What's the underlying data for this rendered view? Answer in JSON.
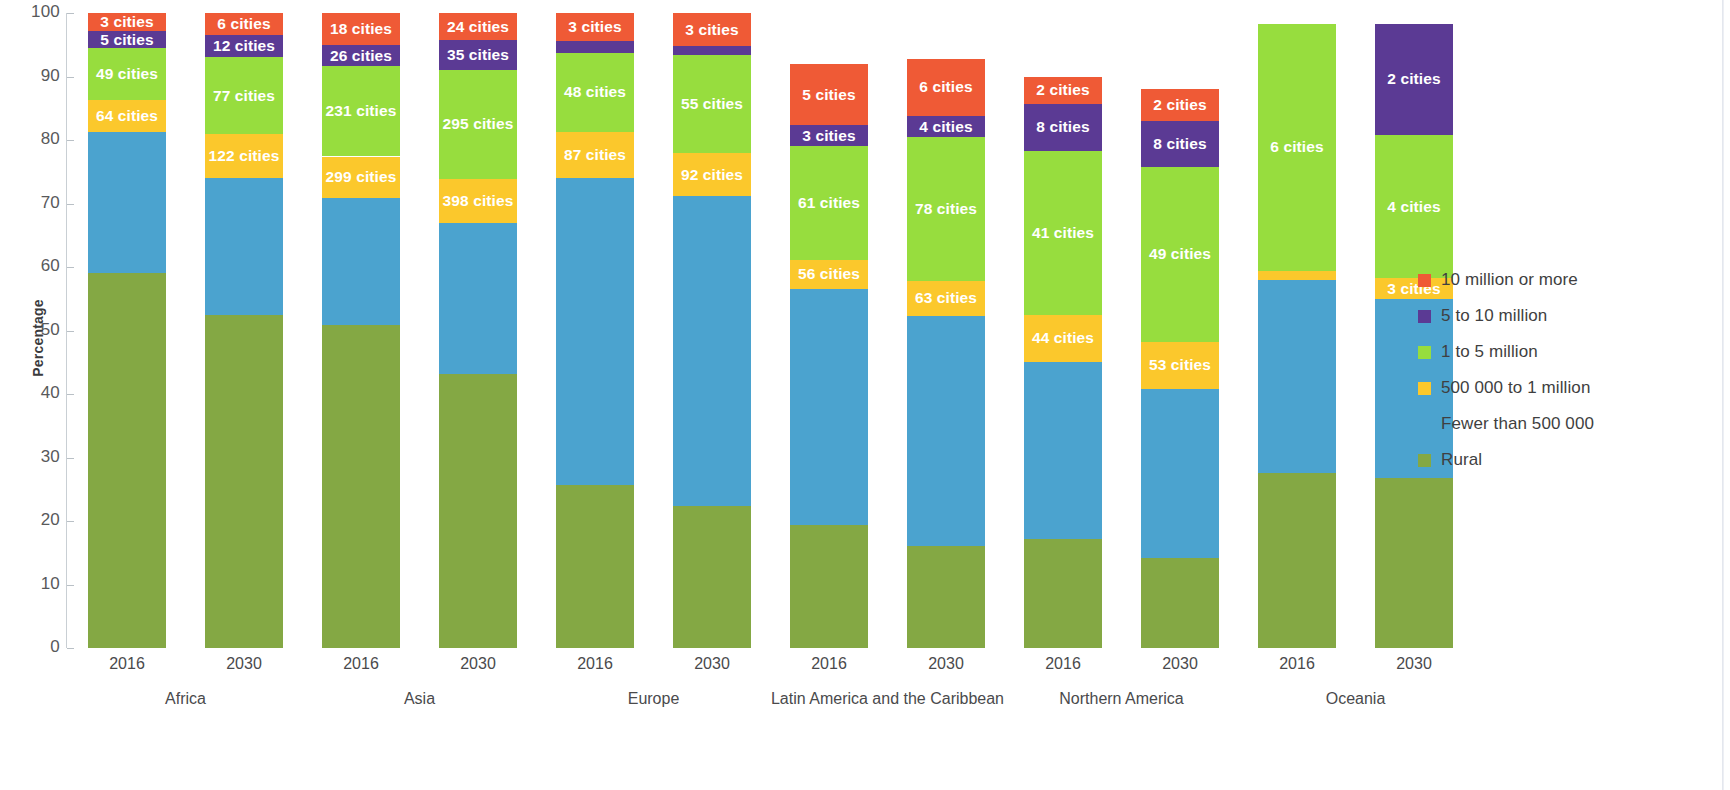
{
  "axis": {
    "y_title": "Percentage",
    "y_ticks": [
      0,
      10,
      20,
      30,
      40,
      50,
      60,
      70,
      80,
      90,
      100
    ],
    "y_min": 0,
    "y_max": 100
  },
  "legend": {
    "items": [
      {
        "label": "10 million or more",
        "color": "#ef5a36"
      },
      {
        "label": "5 to 10 million",
        "color": "#5b3a94"
      },
      {
        "label": "1 to 5 million",
        "color": "#97dd3e"
      },
      {
        "label": "500 000 to 1 million",
        "color": "#fbc82c"
      },
      {
        "label": "Fewer than 500 000",
        "color": "#4ba3cf"
      },
      {
        "label": "Rural",
        "color": "#84a844"
      }
    ]
  },
  "chart_data": {
    "type": "bar",
    "stacked": true,
    "title": "",
    "xlabel": "",
    "ylabel": "Percentage",
    "ylim": [
      0,
      100
    ],
    "grid": false,
    "legend_position": "right",
    "categories": [
      "Africa 2016",
      "Africa 2030",
      "Asia 2016",
      "Asia 2030",
      "Europe 2016",
      "Europe 2030",
      "Latin America and the Caribbean 2016",
      "Latin America and the Caribbean 2030",
      "Northern America 2016",
      "Northern America 2030",
      "Oceania 2016",
      "Oceania 2030"
    ],
    "groups": [
      {
        "name": "Africa",
        "years": [
          "2016",
          "2030"
        ]
      },
      {
        "name": "Asia",
        "years": [
          "2016",
          "2030"
        ]
      },
      {
        "name": "Europe",
        "years": [
          "2016",
          "2030"
        ]
      },
      {
        "name": "Latin America and the Caribbean",
        "years": [
          "2016",
          "2030"
        ]
      },
      {
        "name": "Northern America",
        "years": [
          "2016",
          "2030"
        ]
      },
      {
        "name": "Oceania",
        "years": [
          "2016",
          "2030"
        ]
      }
    ],
    "series": [
      {
        "name": "Rural",
        "color": "#84a844",
        "values": [
          59.0,
          52.5,
          50.8,
          43.1,
          25.7,
          22.3,
          19.3,
          16.0,
          17.1,
          14.2,
          27.5,
          26.8
        ]
      },
      {
        "name": "Fewer than 500 000",
        "color": "#4ba3cf",
        "values": [
          22.3,
          21.5,
          20.1,
          23.8,
          48.3,
          48.9,
          37.3,
          36.3,
          28.0,
          26.6,
          30.4,
          28.2
        ]
      },
      {
        "name": "500 000 to 1 million",
        "color": "#fbc82c",
        "values": [
          5.0,
          7.0,
          6.5,
          7.0,
          7.3,
          6.7,
          4.5,
          5.5,
          7.3,
          7.4,
          1.5,
          3.2
        ]
      },
      {
        "name": "1 to 5 million",
        "color": "#97dd3e",
        "values": [
          8.2,
          12.0,
          14.2,
          17.1,
          12.4,
          15.5,
          18.0,
          22.6,
          25.9,
          27.6,
          38.9,
          22.6
        ]
      },
      {
        "name": "5 to 10 million",
        "color": "#5b3a94",
        "values": [
          2.6,
          3.5,
          3.3,
          4.7,
          1.9,
          1.4,
          3.2,
          3.4,
          7.4,
          7.2,
          0.0,
          17.5
        ]
      },
      {
        "name": "10 million or more",
        "color": "#ef5a36",
        "values": [
          2.9,
          3.5,
          5.1,
          4.3,
          4.4,
          5.2,
          9.7,
          9.0,
          4.3,
          5.0,
          0.0,
          0.0
        ]
      }
    ],
    "bar_labels": [
      {
        "category": "Africa 2016",
        "labels": [
          {
            "series": "Rural",
            "text": ""
          },
          {
            "series": "Fewer than 500 000",
            "text": ""
          },
          {
            "series": "500 000 to 1 million",
            "text": "64 cities"
          },
          {
            "series": "1 to 5 million",
            "text": "49 cities"
          },
          {
            "series": "5 to 10 million",
            "text": "5 cities"
          },
          {
            "series": "10 million or more",
            "text": "3 cities"
          }
        ]
      },
      {
        "category": "Africa 2030",
        "labels": [
          {
            "series": "Rural",
            "text": ""
          },
          {
            "series": "Fewer than 500 000",
            "text": ""
          },
          {
            "series": "500 000 to 1 million",
            "text": "122 cities"
          },
          {
            "series": "1 to 5 million",
            "text": "77 cities"
          },
          {
            "series": "5 to 10 million",
            "text": "12 cities"
          },
          {
            "series": "10 million or more",
            "text": "6 cities"
          }
        ]
      },
      {
        "category": "Asia 2016",
        "labels": [
          {
            "series": "Rural",
            "text": ""
          },
          {
            "series": "Fewer than 500 000",
            "text": ""
          },
          {
            "series": "500 000 to 1 million",
            "text": "299 cities"
          },
          {
            "series": "1 to 5 million",
            "text": "231 cities"
          },
          {
            "series": "5 to 10 million",
            "text": "26 cities"
          },
          {
            "series": "10 million or more",
            "text": "18 cities"
          }
        ]
      },
      {
        "category": "Asia 2030",
        "labels": [
          {
            "series": "Rural",
            "text": ""
          },
          {
            "series": "Fewer than 500 000",
            "text": ""
          },
          {
            "series": "500 000 to 1 million",
            "text": "398 cities"
          },
          {
            "series": "1 to 5 million",
            "text": "295 cities"
          },
          {
            "series": "5 to 10 million",
            "text": "35 cities"
          },
          {
            "series": "10 million or more",
            "text": "24 cities"
          }
        ]
      },
      {
        "category": "Europe 2016",
        "labels": [
          {
            "series": "Rural",
            "text": ""
          },
          {
            "series": "Fewer than 500 000",
            "text": ""
          },
          {
            "series": "500 000 to 1 million",
            "text": "87 cities"
          },
          {
            "series": "1 to 5 million",
            "text": "48 cities"
          },
          {
            "series": "5 to 10 million",
            "text": "3 cities"
          },
          {
            "series": "10 million or more",
            "text": "3 cities"
          }
        ]
      },
      {
        "category": "Europe 2030",
        "labels": [
          {
            "series": "Rural",
            "text": ""
          },
          {
            "series": "Fewer than 500 000",
            "text": ""
          },
          {
            "series": "500 000 to 1 million",
            "text": "92 cities"
          },
          {
            "series": "1 to 5 million",
            "text": "55 cities"
          },
          {
            "series": "5 to 10 million",
            "text": "2 cities"
          },
          {
            "series": "10 million or more",
            "text": "3 cities"
          }
        ]
      },
      {
        "category": "Latin America and the Caribbean 2016",
        "labels": [
          {
            "series": "Rural",
            "text": ""
          },
          {
            "series": "Fewer than 500 000",
            "text": ""
          },
          {
            "series": "500 000 to 1 million",
            "text": "56 cities"
          },
          {
            "series": "1 to 5 million",
            "text": "61 cities"
          },
          {
            "series": "5 to 10 million",
            "text": "3 cities"
          },
          {
            "series": "10 million or more",
            "text": "5 cities"
          }
        ]
      },
      {
        "category": "Latin America and the Caribbean 2030",
        "labels": [
          {
            "series": "Rural",
            "text": ""
          },
          {
            "series": "Fewer than 500 000",
            "text": ""
          },
          {
            "series": "500 000 to 1 million",
            "text": "63 cities"
          },
          {
            "series": "1 to 5 million",
            "text": "78 cities"
          },
          {
            "series": "5 to 10 million",
            "text": "4 cities"
          },
          {
            "series": "10 million or more",
            "text": "6 cities"
          }
        ]
      },
      {
        "category": "Northern America 2016",
        "labels": [
          {
            "series": "Rural",
            "text": ""
          },
          {
            "series": "Fewer than 500 000",
            "text": ""
          },
          {
            "series": "500 000 to 1 million",
            "text": "44 cities"
          },
          {
            "series": "1 to 5 million",
            "text": "41 cities"
          },
          {
            "series": "5 to 10 million",
            "text": "8 cities"
          },
          {
            "series": "10 million or more",
            "text": "2 cities"
          }
        ]
      },
      {
        "category": "Northern America 2030",
        "labels": [
          {
            "series": "Rural",
            "text": ""
          },
          {
            "series": "Fewer than 500 000",
            "text": ""
          },
          {
            "series": "500 000 to 1 million",
            "text": "53 cities"
          },
          {
            "series": "1 to 5 million",
            "text": "49 cities"
          },
          {
            "series": "5 to 10 million",
            "text": "8 cities"
          },
          {
            "series": "10 million or more",
            "text": "2 cities"
          }
        ]
      },
      {
        "category": "Oceania 2016",
        "labels": [
          {
            "series": "Rural",
            "text": ""
          },
          {
            "series": "Fewer than 500 000",
            "text": ""
          },
          {
            "series": "500 000 to 1 million",
            "text": "1 city"
          },
          {
            "series": "1 to 5 million",
            "text": "6 cities"
          },
          {
            "series": "5 to 10 million",
            "text": ""
          },
          {
            "series": "10 million or more",
            "text": ""
          }
        ]
      },
      {
        "category": "Oceania 2030",
        "labels": [
          {
            "series": "Rural",
            "text": ""
          },
          {
            "series": "Fewer than 500 000",
            "text": ""
          },
          {
            "series": "500 000 to 1 million",
            "text": "3 cities"
          },
          {
            "series": "1 to 5 million",
            "text": "4 cities"
          },
          {
            "series": "5 to 10 million",
            "text": "2 cities"
          },
          {
            "series": "10 million or more",
            "text": ""
          }
        ]
      }
    ]
  }
}
